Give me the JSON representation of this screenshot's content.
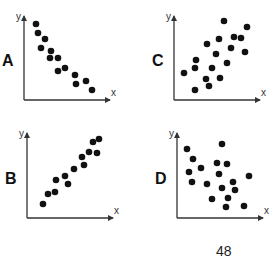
{
  "page_number": "48",
  "chart_data": [
    {
      "type": "scatter",
      "panel_label": "A",
      "xlabel": "x",
      "ylabel": "y",
      "description": "strong negative correlation",
      "origin": [
        24,
        100
      ],
      "axis_end": {
        "x": 110,
        "y": 16
      },
      "points": [
        [
          36,
          24
        ],
        [
          38,
          33
        ],
        [
          45,
          39
        ],
        [
          41,
          48
        ],
        [
          51,
          51
        ],
        [
          50,
          58
        ],
        [
          58,
          58
        ],
        [
          58,
          71
        ],
        [
          65,
          68
        ],
        [
          75,
          75
        ],
        [
          76,
          84
        ],
        [
          86,
          81
        ],
        [
          92,
          90
        ]
      ]
    },
    {
      "type": "scatter",
      "panel_label": "C",
      "xlabel": "x",
      "ylabel": "y",
      "description": "weak positive correlation",
      "origin": [
        174,
        100
      ],
      "axis_end": {
        "x": 260,
        "y": 16
      },
      "points": [
        [
          224,
          21
        ],
        [
          247,
          27
        ],
        [
          234,
          37
        ],
        [
          241,
          38
        ],
        [
          219,
          39
        ],
        [
          207,
          44
        ],
        [
          231,
          48
        ],
        [
          245,
          52
        ],
        [
          216,
          54
        ],
        [
          196,
          60
        ],
        [
          227,
          63
        ],
        [
          195,
          68
        ],
        [
          212,
          68
        ],
        [
          184,
          73
        ],
        [
          220,
          78
        ],
        [
          206,
          79
        ],
        [
          209,
          86
        ],
        [
          195,
          90
        ]
      ]
    },
    {
      "type": "scatter",
      "panel_label": "B",
      "xlabel": "x",
      "ylabel": "y",
      "description": "strong positive correlation",
      "origin": [
        27,
        218
      ],
      "axis_end": {
        "x": 113,
        "y": 133
      },
      "points": [
        [
          99,
          139
        ],
        [
          93,
          142
        ],
        [
          89,
          152
        ],
        [
          97,
          153
        ],
        [
          82,
          157
        ],
        [
          84,
          165
        ],
        [
          74,
          169
        ],
        [
          65,
          176
        ],
        [
          56,
          180
        ],
        [
          68,
          184
        ],
        [
          48,
          194
        ],
        [
          55,
          192
        ],
        [
          43,
          204
        ]
      ]
    },
    {
      "type": "scatter",
      "panel_label": "D",
      "xlabel": "x",
      "ylabel": "y",
      "description": "no correlation",
      "origin": [
        177,
        218
      ],
      "axis_end": {
        "x": 263,
        "y": 133
      },
      "points": [
        [
          222,
          144
        ],
        [
          187,
          149
        ],
        [
          193,
          159
        ],
        [
          217,
          163
        ],
        [
          227,
          164
        ],
        [
          201,
          168
        ],
        [
          189,
          172
        ],
        [
          219,
          174
        ],
        [
          249,
          176
        ],
        [
          192,
          182
        ],
        [
          233,
          182
        ],
        [
          207,
          184
        ],
        [
          222,
          188
        ],
        [
          235,
          190
        ],
        [
          212,
          199
        ],
        [
          228,
          198
        ],
        [
          226,
          207
        ],
        [
          244,
          206
        ]
      ]
    }
  ]
}
